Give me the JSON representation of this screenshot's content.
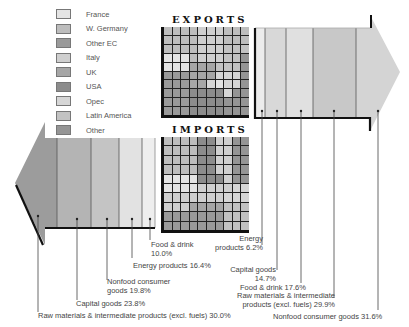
{
  "legend": {
    "items": [
      {
        "label": "France",
        "color": "#e4e4e4"
      },
      {
        "label": "W. Germany",
        "color": "#bdbdbd"
      },
      {
        "label": "Other EC",
        "color": "#9a9a9a"
      },
      {
        "label": "Italy",
        "color": "#cfcfcf"
      },
      {
        "label": "UK",
        "color": "#a6a6a6"
      },
      {
        "label": "USA",
        "color": "#8c8c8c"
      },
      {
        "label": "Opec",
        "color": "#d6d6d6"
      },
      {
        "label": "Latin America",
        "color": "#c2c2c2"
      },
      {
        "label": "Other",
        "color": "#959595"
      }
    ]
  },
  "exports": {
    "title": "EXPORTS",
    "grid": [
      [
        1,
        1,
        1,
        1,
        3,
        3,
        3,
        1,
        1,
        1
      ],
      [
        1,
        1,
        1,
        1,
        3,
        3,
        3,
        1,
        1,
        1
      ],
      [
        1,
        1,
        1,
        1,
        3,
        3,
        3,
        7,
        7,
        7
      ],
      [
        0,
        0,
        0,
        1,
        3,
        3,
        3,
        7,
        7,
        8
      ],
      [
        0,
        0,
        0,
        4,
        4,
        4,
        7,
        7,
        7,
        8
      ],
      [
        2,
        2,
        2,
        4,
        4,
        4,
        6,
        6,
        6,
        8
      ],
      [
        2,
        2,
        2,
        4,
        4,
        6,
        0,
        6,
        6,
        8
      ],
      [
        2,
        2,
        2,
        5,
        5,
        5,
        5,
        6,
        8,
        8
      ],
      [
        2,
        2,
        2,
        5,
        5,
        5,
        5,
        8,
        8,
        8
      ],
      [
        2,
        2,
        2,
        5,
        5,
        5,
        5,
        8,
        8,
        8
      ]
    ],
    "segments": [
      {
        "label": "Energy products",
        "value": "6.2%",
        "color": "#ececec"
      },
      {
        "label": "Capital goods",
        "value": "14.7%",
        "color": "#d8d8d8"
      },
      {
        "label": "Food & drink",
        "value": "17.6%",
        "color": "#e0e0e0"
      },
      {
        "label": "Raw materials & intermediate products (excl. fuels)",
        "value": "29.9%",
        "color": "#c8c8c8"
      },
      {
        "label": "Nonfood consumer goods",
        "value": "31.6%",
        "color": "#d2d2d2"
      }
    ],
    "labels": {
      "energy_1": "Energy",
      "energy_2": "products 6.2%",
      "capital_1": "Capital goods",
      "capital_2": "14.7%",
      "food": "Food & drink 17.6%",
      "raw_1": "Raw materials & intermediate",
      "raw_2": "products (excl. fuels) 29.9%",
      "nonfood": "Nonfood consumer goods 31.6%"
    }
  },
  "imports": {
    "title": "IMPORTS",
    "grid": [
      [
        1,
        1,
        1,
        1,
        5,
        5,
        3,
        3,
        8,
        8
      ],
      [
        1,
        1,
        1,
        1,
        5,
        5,
        3,
        3,
        8,
        8
      ],
      [
        1,
        1,
        1,
        1,
        5,
        5,
        3,
        3,
        8,
        8
      ],
      [
        1,
        1,
        1,
        1,
        5,
        5,
        3,
        3,
        8,
        8
      ],
      [
        0,
        0,
        0,
        0,
        5,
        5,
        5,
        3,
        8,
        8
      ],
      [
        0,
        0,
        0,
        0,
        3,
        3,
        3,
        3,
        6,
        6
      ],
      [
        3,
        3,
        3,
        3,
        3,
        3,
        3,
        6,
        6,
        6
      ],
      [
        3,
        3,
        3,
        4,
        4,
        4,
        4,
        7,
        7,
        7
      ],
      [
        2,
        2,
        2,
        2,
        2,
        2,
        2,
        7,
        7,
        7
      ],
      [
        2,
        2,
        2,
        2,
        2,
        2,
        2,
        7,
        7,
        7
      ]
    ],
    "segments": [
      {
        "label": "Raw materials & intermediate products (excl. fuels)",
        "value": "30.0%",
        "color": "#9c9c9c"
      },
      {
        "label": "Capital goods",
        "value": "23.8%",
        "color": "#b4b4b4"
      },
      {
        "label": "Nonfood consumer goods",
        "value": "19.8%",
        "color": "#c4c4c4"
      },
      {
        "label": "Energy products",
        "value": "16.4%",
        "color": "#e2e2e2"
      },
      {
        "label": "Food & drink",
        "value": "10.0%",
        "color": "#eeeeee"
      }
    ],
    "labels": {
      "food_1": "Food & drink",
      "food_2": "10.0%",
      "energy": "Energy products 16.4%",
      "nonfood_1": "Nonfood consumer",
      "nonfood_2": "goods 19.8%",
      "capital": "Capital goods 23.8%",
      "raw": "Raw materials & intermediate products (excl. fuels) 30.0%"
    }
  }
}
